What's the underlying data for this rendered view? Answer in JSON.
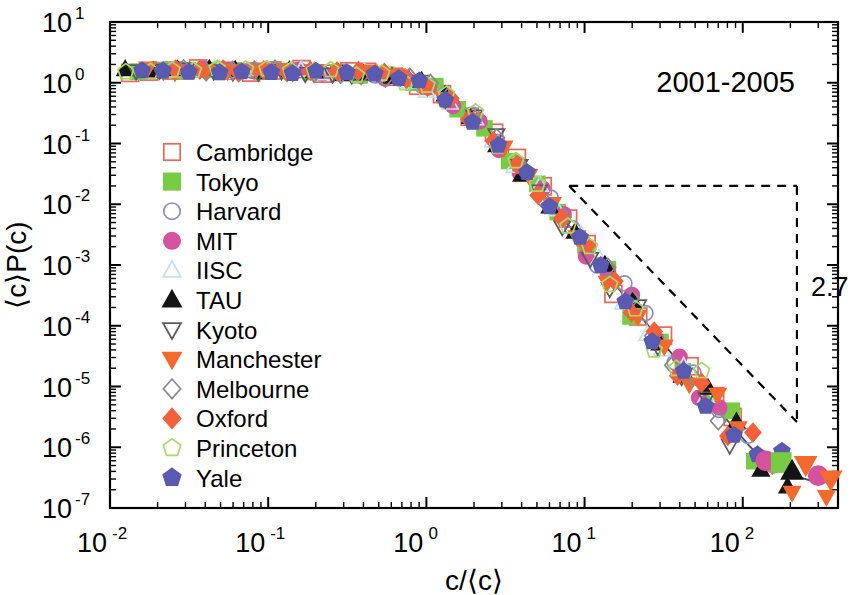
{
  "chart_data": {
    "type": "scatter",
    "title": "",
    "annotation": "2001-2005",
    "xlabel": "c/⟨c⟩",
    "ylabel": "⟨c⟪P(c)",
    "ylabel_display": "⟨c⟩P(c)",
    "xscale": "log",
    "yscale": "log",
    "xlim": [
      0.01,
      400
    ],
    "ylim": [
      1e-07,
      10
    ],
    "grid": false,
    "legend_position": "left-middle",
    "xticks": [
      {
        "value": 0.01,
        "label": "10",
        "exp": "-2"
      },
      {
        "value": 0.1,
        "label": "10",
        "exp": "-1"
      },
      {
        "value": 1,
        "label": "10",
        "exp": "0"
      },
      {
        "value": 10,
        "label": "10",
        "exp": "1"
      },
      {
        "value": 100,
        "label": "10",
        "exp": "2"
      }
    ],
    "yticks": [
      {
        "value": 10,
        "label": "10",
        "exp": "1"
      },
      {
        "value": 1,
        "label": "10",
        "exp": "0"
      },
      {
        "value": 0.1,
        "label": "10",
        "exp": "-1"
      },
      {
        "value": 0.01,
        "label": "10",
        "exp": "-2"
      },
      {
        "value": 0.001,
        "label": "10",
        "exp": "-3"
      },
      {
        "value": 0.0001,
        "label": "10",
        "exp": "-4"
      },
      {
        "value": 1e-05,
        "label": "10",
        "exp": "-5"
      },
      {
        "value": 1e-06,
        "label": "10",
        "exp": "-6"
      },
      {
        "value": 1e-07,
        "label": "10",
        "exp": "-7"
      }
    ],
    "slope_marker": {
      "label": "2.7",
      "exponent": 2.7,
      "x_start": 8.0,
      "x_end": 220.0,
      "y_start": 0.02,
      "style": "dashed-triangle"
    },
    "fit_line": {
      "style": "solid",
      "color": "#4a4a4a",
      "description": "guide-to-the-eye curve through collapsed data"
    },
    "series": [
      {
        "name": "Cambridge",
        "marker": "square",
        "filled": false,
        "color": "#e8695a"
      },
      {
        "name": "Tokyo",
        "marker": "square",
        "filled": true,
        "color": "#77cc44"
      },
      {
        "name": "Harvard",
        "marker": "circle",
        "filled": false,
        "color": "#8c8fc4"
      },
      {
        "name": "MIT",
        "marker": "circle",
        "filled": true,
        "color": "#d4539e"
      },
      {
        "name": "IISC",
        "marker": "triangle-up",
        "filled": false,
        "color": "#bfe4ec"
      },
      {
        "name": "TAU",
        "marker": "triangle-up",
        "filled": true,
        "color": "#141414"
      },
      {
        "name": "Kyoto",
        "marker": "triangle-down",
        "filled": false,
        "color": "#5a5a5a"
      },
      {
        "name": "Manchester",
        "marker": "triangle-down",
        "filled": true,
        "color": "#f4692e"
      },
      {
        "name": "Melbourne",
        "marker": "diamond",
        "filled": false,
        "color": "#8a8a8a"
      },
      {
        "name": "Oxford",
        "marker": "diamond",
        "filled": true,
        "color": "#f4603a"
      },
      {
        "name": "Princeton",
        "marker": "pentagon",
        "filled": false,
        "color": "#a8d96a"
      },
      {
        "name": "Yale",
        "marker": "pentagon",
        "filled": true,
        "color": "#5a5ab0"
      }
    ],
    "curve_x": [
      0.012,
      0.018,
      0.026,
      0.034,
      0.045,
      0.06,
      0.08,
      0.105,
      0.135,
      0.175,
      0.23,
      0.3,
      0.39,
      0.5,
      0.65,
      0.85,
      1.1,
      1.4,
      1.8,
      2.3,
      3.0,
      3.9,
      5.0,
      6.5,
      8.5,
      11,
      14,
      18,
      23,
      30,
      39,
      50,
      65,
      85,
      110,
      140,
      180,
      230,
      300
    ],
    "curve_y": [
      1.55,
      1.6,
      1.62,
      1.6,
      1.58,
      1.6,
      1.55,
      1.58,
      1.55,
      1.52,
      1.5,
      1.48,
      1.42,
      1.35,
      1.22,
      1.05,
      0.8,
      0.55,
      0.33,
      0.18,
      0.085,
      0.04,
      0.019,
      0.0085,
      0.0036,
      0.00155,
      0.00068,
      0.0003,
      0.000135,
      5.85e-05,
      2.65e-05,
      1.2e-05,
      5.2e-06,
      2.3e-06,
      1.05e-06,
      5.5e-07,
      4e-07,
      3.2e-07,
      2.6e-07
    ],
    "tail_points": [
      {
        "x": 140,
        "y": 6e-07
      },
      {
        "x": 175,
        "y": 5.6e-07
      },
      {
        "x": 205,
        "y": 4e-07
      },
      {
        "x": 250,
        "y": 5.2e-07
      },
      {
        "x": 300,
        "y": 3.4e-07
      },
      {
        "x": 360,
        "y": 3e-07
      }
    ]
  },
  "legend": {
    "items": [
      {
        "label": "Cambridge"
      },
      {
        "label": "Tokyo"
      },
      {
        "label": "Harvard"
      },
      {
        "label": "MIT"
      },
      {
        "label": "IISC"
      },
      {
        "label": "TAU"
      },
      {
        "label": "Kyoto"
      },
      {
        "label": "Manchester"
      },
      {
        "label": "Melbourne"
      },
      {
        "label": "Oxford"
      },
      {
        "label": "Princeton"
      },
      {
        "label": "Yale"
      }
    ]
  }
}
